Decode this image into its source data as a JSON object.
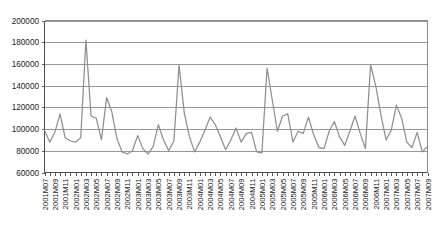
{
  "chart_data": {
    "type": "line",
    "title": "",
    "subtitle": "",
    "xlabel": "",
    "ylabel": "",
    "ylim": [
      60000,
      200000
    ],
    "ytick_values": [
      60000,
      80000,
      100000,
      120000,
      140000,
      160000,
      180000,
      200000
    ],
    "ytick_labels": [
      "60000",
      "80000",
      "100000",
      "120000",
      "140000",
      "160000",
      "180000",
      "200000"
    ],
    "grid": true,
    "legend": null,
    "legend_position": "none",
    "line_color": "#8f8f8f",
    "grid_color": "#8c8c8c",
    "axis_color": "#4d4d4d",
    "xtick_label_interval": 2,
    "xtick_labels_shown": [
      "2001M07",
      "2001M09",
      "2001M11",
      "2002M01",
      "2002M03",
      "2002M05",
      "2002M07",
      "2002M09",
      "2002M11",
      "2003M01",
      "2003M03",
      "2003M05",
      "2003M07",
      "2003M09",
      "2003M11",
      "2004M01",
      "2004M03",
      "2004M05",
      "2004M07",
      "2004M09",
      "2004M11",
      "2005M01",
      "2005M03",
      "2005M05",
      "2005M07",
      "2005M09"
    ],
    "x": [
      "2001M07",
      "2001M08",
      "2001M09",
      "2001M10",
      "2001M11",
      "2001M12",
      "2002M01",
      "2002M02",
      "2002M03",
      "2002M04",
      "2002M05",
      "2002M06",
      "2002M07",
      "2002M08",
      "2002M09",
      "2002M10",
      "2002M11",
      "2002M12",
      "2003M01",
      "2003M02",
      "2003M03",
      "2003M04",
      "2003M05",
      "2003M06",
      "2003M07",
      "2003M08",
      "2003M09",
      "2003M10",
      "2003M11",
      "2003M12",
      "2004M01",
      "2004M02",
      "2004M03",
      "2004M04",
      "2004M05",
      "2004M06",
      "2004M07",
      "2004M08",
      "2004M09",
      "2004M10",
      "2004M11",
      "2004M12",
      "2005M01",
      "2005M02",
      "2005M03",
      "2005M04",
      "2005M05",
      "2005M06",
      "2005M07",
      "2005M08",
      "2005M09"
    ],
    "values": [
      99000,
      88000,
      97000,
      114000,
      92000,
      89000,
      88000,
      92000,
      182000,
      112000,
      110000,
      90000,
      129000,
      116000,
      91000,
      79000,
      77000,
      80000,
      94000,
      82000,
      77000,
      84000,
      104000,
      90000,
      80000,
      89000,
      159000,
      115000,
      93000,
      79000,
      88000,
      99000,
      111000,
      104000,
      93000,
      81000,
      90000,
      101000,
      88000,
      96000,
      97000,
      79000,
      78000,
      156000,
      127000,
      98000,
      112000,
      114000,
      88000,
      98000,
      96000
    ],
    "values_extended": [
      111000,
      95000,
      83000,
      82000,
      98000,
      107000,
      93000,
      85000,
      98000,
      112000,
      96000,
      82000,
      159000,
      140000,
      113000,
      90000,
      99000,
      122000,
      110000,
      88000,
      83000,
      97000,
      79000,
      84000
    ]
  }
}
